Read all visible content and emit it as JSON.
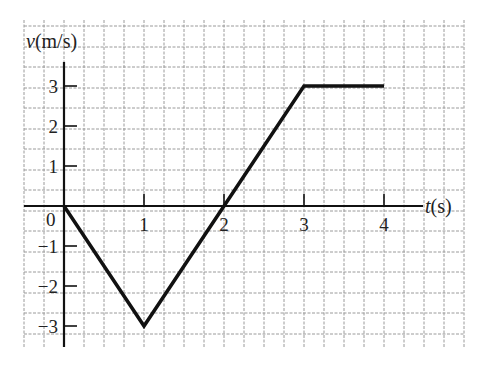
{
  "chart_data": {
    "type": "line",
    "title": "",
    "xlabel_var": "t",
    "xlabel_unit": "(s)",
    "ylabel_var": "v",
    "ylabel_unit": "(m/s)",
    "x": [
      0,
      1,
      2,
      3,
      4
    ],
    "series": [
      {
        "name": "v(t)",
        "points": [
          [
            0,
            0
          ],
          [
            1,
            -3
          ],
          [
            3,
            3
          ],
          [
            4,
            3
          ]
        ]
      }
    ],
    "xticks": [
      "1",
      "2",
      "3",
      "4"
    ],
    "yticks": [
      "3",
      "2",
      "1",
      "-1",
      "-2",
      "-3"
    ],
    "origin_label": "0",
    "xlim": [
      0,
      4.5
    ],
    "ylim": [
      -3.5,
      3.5
    ],
    "grid": true,
    "legend": null,
    "colors": {
      "line": "#111111",
      "grid": "#9a9a9a",
      "axis": "#111111"
    }
  }
}
